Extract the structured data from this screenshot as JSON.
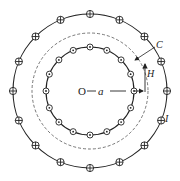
{
  "diagram": {
    "center_label": "O",
    "radius_label": "a",
    "field_label": "H",
    "loop_label": "C",
    "current_label": "I",
    "outer_conductor": {
      "symbol": "current-into-page (⊕)",
      "count": 16
    },
    "inner_conductor": {
      "symbol": "current-out-of-page (⊙)",
      "count": 16
    },
    "colors": {
      "stroke": "#222222",
      "background": "#ffffff"
    }
  }
}
